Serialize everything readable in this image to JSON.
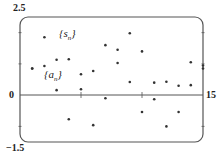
{
  "chart_data": {
    "type": "scatter",
    "title": "",
    "xlabel": "",
    "ylabel": "",
    "xlim": [
      0,
      15
    ],
    "ylim": [
      -1.5,
      2.5
    ],
    "tick_labels": {
      "y_top": "2.5",
      "y_zero": "0",
      "y_bottom": "-1.5",
      "x_right": "15"
    },
    "legend": [
      "{s_n}",
      "{a_n}"
    ],
    "annotations": [
      {
        "text": "{s_n}",
        "x": 4.3,
        "y": 1.95
      },
      {
        "text": "{a_n}",
        "x": 1.6,
        "y": 0.55
      }
    ],
    "series": [
      {
        "name": "{s_n}",
        "points": [
          [
            1,
            0.85
          ],
          [
            2,
            0.93
          ],
          [
            3,
            1.13
          ],
          [
            4,
            1.15
          ],
          [
            5,
            0.67
          ],
          [
            6,
            0.77
          ],
          [
            7,
            1.6
          ],
          [
            8,
            1.45
          ],
          [
            9,
            1.98
          ],
          [
            10,
            1.4
          ],
          [
            11,
            0.4
          ],
          [
            12,
            0.43
          ],
          [
            13,
            0.3
          ],
          [
            14,
            1.05
          ],
          [
            15,
            0.95
          ]
        ]
      },
      {
        "name": "{a_n}",
        "points": [
          [
            1,
            0.85
          ],
          [
            2,
            1.85
          ],
          [
            3,
            0.16
          ],
          [
            4,
            -0.77
          ],
          [
            5,
            0.19
          ],
          [
            6,
            -0.96
          ],
          [
            7,
            -0.1
          ],
          [
            8,
            1.03
          ],
          [
            9,
            0.42
          ],
          [
            10,
            -0.54
          ],
          [
            11,
            -0.13
          ],
          [
            12,
            -1.0
          ],
          [
            13,
            -0.54
          ],
          [
            14,
            0.32
          ],
          [
            15,
            0.85
          ]
        ]
      }
    ],
    "grid": false
  },
  "labels": {
    "y_top": "2.5",
    "y_zero": "0",
    "y_bottom": "−1.5",
    "x_right": "15",
    "s_n": "{s",
    "s_sub": "n",
    "a_n": "{a",
    "a_sub": "n"
  }
}
